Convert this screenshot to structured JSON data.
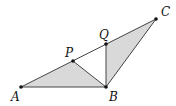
{
  "diagram": {
    "type": "geometry-figure",
    "points": [
      {
        "id": "A",
        "label": "A",
        "x": 21,
        "y": 87,
        "lx": 11,
        "ly": 101
      },
      {
        "id": "B",
        "label": "B",
        "x": 106,
        "y": 87,
        "lx": 109,
        "ly": 101
      },
      {
        "id": "C",
        "label": "C",
        "x": 156,
        "y": 19,
        "lx": 161,
        "ly": 16
      },
      {
        "id": "P",
        "label": "P",
        "x": 73,
        "y": 61,
        "lx": 65,
        "ly": 57
      },
      {
        "id": "Q",
        "label": "Q",
        "x": 106,
        "y": 44,
        "lx": 99,
        "ly": 39
      }
    ],
    "segments": [
      [
        "A",
        "C"
      ],
      [
        "A",
        "B"
      ],
      [
        "P",
        "B"
      ],
      [
        "Q",
        "B"
      ],
      [
        "B",
        "C"
      ]
    ],
    "shaded_regions": [
      [
        "A",
        "P",
        "B"
      ],
      [
        "Q",
        "B",
        "C"
      ]
    ],
    "colors": {
      "fill": "#d9d9d9",
      "stroke": "#444444",
      "point": "#111111"
    }
  }
}
